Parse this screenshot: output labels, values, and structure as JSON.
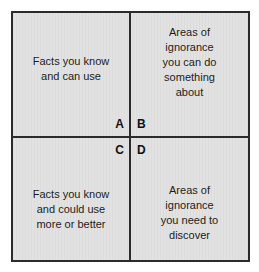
{
  "diagram": {
    "type": "2x2-matrix",
    "background_color": "#dedede",
    "border_color": "#2b2b2b",
    "text_color": "#1c1c1c",
    "quadrants": [
      {
        "key": "A",
        "label": "A",
        "position": "top-left",
        "text": "Facts you know\nand can use"
      },
      {
        "key": "B",
        "label": "B",
        "position": "top-right",
        "text": "Areas of\nignorance\nyou can do\nsomething\nabout"
      },
      {
        "key": "C",
        "label": "C",
        "position": "bottom-left",
        "text": "Facts you know\nand could use\nmore or better"
      },
      {
        "key": "D",
        "label": "D",
        "position": "bottom-right",
        "text": "Areas of\nignorance\nyou need to\ndiscover"
      }
    ]
  }
}
